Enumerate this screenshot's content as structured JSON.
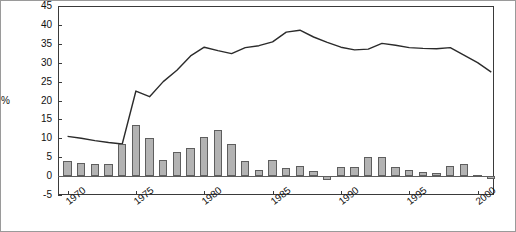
{
  "chart_data": {
    "type": "bar",
    "title": "",
    "subtitle": "",
    "xlabel": "",
    "ylabel": "%",
    "ylim": [
      -5,
      45
    ],
    "ytick_step": 5,
    "yticks": [
      -5,
      0,
      5,
      10,
      15,
      20,
      25,
      30,
      35,
      40,
      45
    ],
    "ytick_labels": [
      "-5",
      "0",
      "5",
      "10",
      "15",
      "20",
      "25",
      "30",
      "35",
      "40",
      "45"
    ],
    "xlim": [
      1969.3,
      2001.2
    ],
    "xticks": [
      1970,
      1975,
      1980,
      1985,
      1990,
      1995,
      2000
    ],
    "xtick_labels": [
      "1970",
      "1975",
      "1980",
      "1985",
      "1990",
      "1995",
      "2000"
    ],
    "grid": false,
    "legend": false,
    "legend_position": "none",
    "categories": [
      1970,
      1971,
      1972,
      1973,
      1974,
      1975,
      1976,
      1977,
      1978,
      1979,
      1980,
      1981,
      1982,
      1983,
      1984,
      1985,
      1986,
      1987,
      1988,
      1989,
      1990,
      1991,
      1992,
      1993,
      1994,
      1995,
      1996,
      1997,
      1998,
      1999,
      2000,
      2001
    ],
    "series": [
      {
        "name": "annual change",
        "type": "bar",
        "color": "#b3b3b3",
        "edge_color": "#5e5e5e",
        "values": [
          3.9,
          3.5,
          3.2,
          3.2,
          8.4,
          13.4,
          10.1,
          4.3,
          6.3,
          7.5,
          10.4,
          12.1,
          8.4,
          4.1,
          1.6,
          4.3,
          2.1,
          2.6,
          1.3,
          -1.0,
          2.3,
          2.5,
          5.1,
          5.0,
          2.4,
          1.5,
          1.2,
          0.7,
          2.6,
          3.3,
          0.4,
          -0.9
        ]
      },
      {
        "name": "level",
        "type": "line",
        "color": "#2b2b2b",
        "x": [
          1970,
          1971,
          1972,
          1973,
          1974,
          1975,
          1976,
          1977,
          1978,
          1979,
          1980,
          1981,
          1982,
          1983,
          1984,
          1985,
          1986,
          1987,
          1988,
          1989,
          1990,
          1991,
          1992,
          1993,
          1994,
          1995,
          1996,
          1997,
          1998,
          1999,
          2000,
          2001
        ],
        "values": [
          10.5,
          10.0,
          9.4,
          8.9,
          8.5,
          22.5,
          21.0,
          25.0,
          28.0,
          31.8,
          34.1,
          33.2,
          32.4,
          34.0,
          34.5,
          35.5,
          38.1,
          38.6,
          36.8,
          35.4,
          34.1,
          33.4,
          33.6,
          35.1,
          34.6,
          34.0,
          33.8,
          33.7,
          34.0,
          32.0,
          30.0,
          27.5
        ]
      }
    ]
  },
  "figure": {
    "percent_label": "%"
  }
}
